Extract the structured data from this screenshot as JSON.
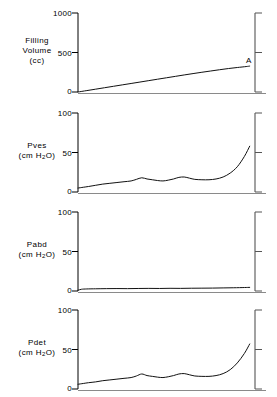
{
  "figure": {
    "colors": {
      "trace": "#111111",
      "spine": "#000000",
      "right_spine": "#555555",
      "baseline": "#8a8a8a",
      "background": "#ffffff"
    }
  },
  "chart_data": [
    {
      "type": "line",
      "panel_id": "filling-volume",
      "title": "",
      "ylabel_lines": [
        "Filling",
        "Volume",
        "(cc)"
      ],
      "ylabel": "Filling Volume (cc)",
      "xlabel": "",
      "ylim": [
        0,
        1000
      ],
      "yticks": [
        0,
        500,
        1000
      ],
      "ytick_labels": [
        "0",
        "500",
        "1000"
      ],
      "xlim": [
        0,
        100
      ],
      "grid": false,
      "legend": "none",
      "annotations": [
        {
          "text": "A",
          "x": 95,
          "y": 390
        }
      ],
      "series": [
        {
          "name": "Filling Volume",
          "x": [
            0,
            5,
            10,
            15,
            20,
            25,
            30,
            35,
            40,
            45,
            50,
            55,
            60,
            65,
            70,
            75,
            80,
            85,
            90,
            95,
            97
          ],
          "values": [
            0,
            18,
            36,
            54,
            72,
            90,
            108,
            126,
            144,
            162,
            180,
            198,
            216,
            233,
            250,
            266,
            282,
            297,
            310,
            322,
            328
          ]
        }
      ]
    },
    {
      "type": "line",
      "panel_id": "pves",
      "title": "",
      "ylabel_lines": [
        "Pves",
        "(cm H2O)"
      ],
      "ylabel": "Pves (cm H2O)",
      "xlabel": "",
      "ylim": [
        0,
        100
      ],
      "yticks": [
        0,
        50,
        100
      ],
      "ytick_labels": [
        "0",
        "50",
        "100"
      ],
      "xlim": [
        0,
        100
      ],
      "grid": false,
      "legend": "none",
      "annotations": [],
      "series": [
        {
          "name": "Pves",
          "x": [
            0,
            3,
            6,
            10,
            14,
            18,
            22,
            26,
            30,
            33,
            36,
            39,
            42,
            45,
            48,
            51,
            54,
            57,
            60,
            63,
            66,
            70,
            74,
            78,
            82,
            86,
            90,
            94,
            97
          ],
          "values": [
            5,
            6,
            7,
            8.5,
            10,
            11,
            12,
            13,
            14,
            16,
            18,
            16.5,
            15.5,
            14.5,
            14,
            15,
            16.5,
            18.5,
            19,
            17.5,
            16,
            15.5,
            15.5,
            16.5,
            19,
            24,
            32,
            45,
            58
          ]
        }
      ]
    },
    {
      "type": "line",
      "panel_id": "pabd",
      "title": "",
      "ylabel_lines": [
        "Pabd",
        "(cm H2O)"
      ],
      "ylabel": "Pabd (cm H2O)",
      "xlabel": "",
      "ylim": [
        0,
        100
      ],
      "yticks": [
        0,
        50,
        100
      ],
      "ytick_labels": [
        "0",
        "50",
        "100"
      ],
      "xlim": [
        0,
        100
      ],
      "grid": false,
      "legend": "none",
      "annotations": [],
      "series": [
        {
          "name": "Pabd",
          "x": [
            0,
            2,
            5,
            10,
            16,
            22,
            28,
            34,
            40,
            46,
            52,
            58,
            64,
            70,
            76,
            82,
            88,
            94,
            97
          ],
          "values": [
            1,
            2.2,
            2.6,
            2.8,
            3.0,
            3.1,
            3.0,
            3.2,
            3.3,
            3.2,
            3.4,
            3.3,
            3.5,
            3.6,
            3.7,
            3.9,
            4.1,
            4.4,
            4.6
          ]
        }
      ]
    },
    {
      "type": "line",
      "panel_id": "pdet",
      "title": "",
      "ylabel_lines": [
        "Pdet",
        "(cm H2O)"
      ],
      "ylabel": "Pdet (cm H2O)",
      "xlabel": "",
      "ylim": [
        0,
        100
      ],
      "yticks": [
        0,
        50,
        100
      ],
      "ytick_labels": [
        "0",
        "50",
        "100"
      ],
      "xlim": [
        0,
        100
      ],
      "grid": false,
      "legend": "none",
      "annotations": [],
      "series": [
        {
          "name": "Pdet",
          "x": [
            0,
            3,
            6,
            10,
            14,
            18,
            22,
            26,
            30,
            33,
            36,
            39,
            42,
            45,
            48,
            51,
            54,
            57,
            60,
            63,
            66,
            70,
            74,
            78,
            82,
            86,
            90,
            94,
            97
          ],
          "values": [
            6,
            7,
            8,
            9,
            10.5,
            11.5,
            12.5,
            13.5,
            14.5,
            16.5,
            19,
            17,
            16,
            15,
            14.5,
            15.5,
            17,
            19,
            19.5,
            18,
            16.5,
            16,
            16,
            17,
            19.5,
            24.5,
            33,
            45,
            57
          ]
        }
      ]
    }
  ],
  "panels": {
    "filling_volume": {
      "label_line1": "Filling",
      "label_line2": "Volume",
      "label_line3": "(cc)",
      "tick_top": "1000",
      "tick_mid": "500",
      "tick_bottom": "0",
      "marker_a": "A"
    },
    "pves": {
      "label_line1": "Pves",
      "label_unit_pre": "(cm H",
      "label_unit_sub": "2",
      "label_unit_post": "O)",
      "tick_top": "100",
      "tick_mid": "50",
      "tick_bottom": "0"
    },
    "pabd": {
      "label_line1": "Pabd",
      "label_unit_pre": "(cm H",
      "label_unit_sub": "2",
      "label_unit_post": "O)",
      "tick_top": "100",
      "tick_mid": "50",
      "tick_bottom": "0"
    },
    "pdet": {
      "label_line1": "Pdet",
      "label_unit_pre": "(cm H",
      "label_unit_sub": "2",
      "label_unit_post": "O)",
      "tick_top": "100",
      "tick_mid": "50",
      "tick_bottom": "0"
    }
  }
}
